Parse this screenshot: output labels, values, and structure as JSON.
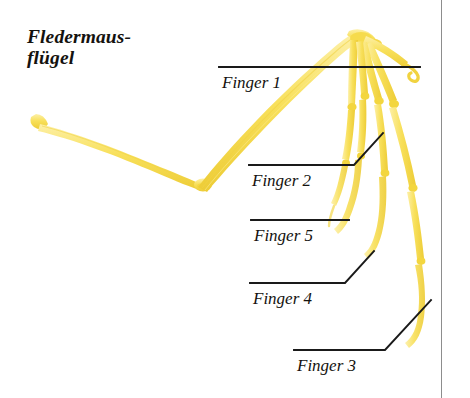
{
  "figure": {
    "title": "Fledermaus-\nflügel",
    "title_line_1": "Fledermaus-",
    "title_line_2": "flügel",
    "bone_color": "#F7DF55",
    "bone_shadow_color": "#EFD03A",
    "line_color": "#1a1a1a",
    "background_color": "#ffffff",
    "border_color": "#8d8d8d"
  },
  "callouts": [
    {
      "id": "finger-1",
      "label": "Finger 1",
      "label_x": 222,
      "label_y": 74,
      "leader": "M 219,67 L 420,67",
      "points_to": "thumb-claw"
    },
    {
      "id": "finger-2",
      "label": "Finger 2",
      "label_x": 252,
      "label_y": 172,
      "leader": "M 249,165 L 354,165 L 383,133",
      "points_to": "second-digit"
    },
    {
      "id": "finger-5",
      "label": "Finger 5",
      "label_x": 254,
      "label_y": 227,
      "leader": "M 251,220 L 349,220",
      "points_to": "fifth-digit"
    },
    {
      "id": "finger-4",
      "label": "Finger 4",
      "label_x": 253,
      "label_y": 290,
      "leader": "M 250,283 L 345,283 L 374,251",
      "points_to": "fourth-digit"
    },
    {
      "id": "finger-3",
      "label": "Finger 3",
      "label_x": 297,
      "label_y": 357,
      "leader": "M 294,350 L 385,350 L 431,300",
      "points_to": "third-digit"
    }
  ],
  "bones": [
    {
      "id": "humerus",
      "name": "humerus-upper-arm-bone"
    },
    {
      "id": "radius-ulna",
      "name": "forearm-bone"
    },
    {
      "id": "carpals",
      "name": "wrist-bones"
    },
    {
      "id": "digit-1",
      "name": "thumb-digit-one"
    },
    {
      "id": "digit-2",
      "name": "digit-two"
    },
    {
      "id": "digit-3",
      "name": "digit-three"
    },
    {
      "id": "digit-4",
      "name": "digit-four"
    },
    {
      "id": "digit-5",
      "name": "digit-five"
    }
  ]
}
